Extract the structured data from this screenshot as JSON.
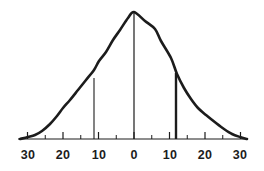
{
  "figure": {
    "kind": "bell-curve-figure",
    "background_color": "#ffffff",
    "ink_color": "#1c1c1c",
    "width": 264,
    "height": 171
  },
  "chart_data": {
    "type": "line",
    "title": "",
    "subtitle": "",
    "xlabel": "",
    "ylabel": "",
    "grid": false,
    "legend": false,
    "legend_position": "none",
    "axis": {
      "orientation": "horizontal",
      "baseline_y_px": 139,
      "x_start_px": 18,
      "x_end_px": 246,
      "center_px": 134,
      "px_per_unit": 3.55,
      "xlim": [
        -32,
        32
      ],
      "ylim": [
        0,
        1
      ],
      "tick_values": [
        -30,
        -25,
        -20,
        -15,
        -10,
        -5,
        0,
        5,
        10,
        15,
        20,
        25,
        30
      ],
      "major_tick_values": [
        -30,
        -20,
        -10,
        0,
        10,
        20,
        30
      ],
      "minor_tick_values": [
        -25,
        -15,
        -5,
        5,
        15,
        25
      ]
    },
    "tick_labels": [
      {
        "text": "30",
        "value": -30,
        "x_px": 28
      },
      {
        "text": "20",
        "value": -20,
        "x_px": 63
      },
      {
        "text": "10",
        "value": -10,
        "x_px": 99
      },
      {
        "text": "0",
        "value": 0,
        "x_px": 134
      },
      {
        "text": "10",
        "value": 10,
        "x_px": 170
      },
      {
        "text": "20",
        "value": 20,
        "x_px": 205
      },
      {
        "text": "30",
        "value": 30,
        "x_px": 240
      }
    ],
    "curve": {
      "name": "normal-distribution-curve",
      "stroke_color": "#1c1c1c",
      "stroke_width": 2.6,
      "peak": {
        "x": 0,
        "y": 1.0,
        "x_px": 134,
        "y_px": 12
      },
      "points": [
        {
          "x": -32,
          "y": 0.0,
          "x_px": 20,
          "y_px": 139
        },
        {
          "x": -30,
          "y": 0.01,
          "x_px": 28,
          "y_px": 137
        },
        {
          "x": -28,
          "y": 0.03,
          "x_px": 35,
          "y_px": 135
        },
        {
          "x": -26,
          "y": 0.07,
          "x_px": 42,
          "y_px": 131
        },
        {
          "x": -24,
          "y": 0.12,
          "x_px": 50,
          "y_px": 124
        },
        {
          "x": -22,
          "y": 0.19,
          "x_px": 57,
          "y_px": 116
        },
        {
          "x": -20,
          "y": 0.27,
          "x_px": 63,
          "y_px": 108
        },
        {
          "x": -18,
          "y": 0.35,
          "x_px": 70,
          "y_px": 100
        },
        {
          "x": -16,
          "y": 0.44,
          "x_px": 78,
          "y_px": 90
        },
        {
          "x": -14,
          "y": 0.53,
          "x_px": 86,
          "y_px": 80
        },
        {
          "x": -12,
          "y": 0.62,
          "x_px": 94,
          "y_px": 70
        },
        {
          "x": -10,
          "y": 0.71,
          "x_px": 99,
          "y_px": 61
        },
        {
          "x": -8,
          "y": 0.79,
          "x_px": 106,
          "y_px": 52
        },
        {
          "x": -6,
          "y": 0.87,
          "x_px": 113,
          "y_px": 40
        },
        {
          "x": -4,
          "y": 0.93,
          "x_px": 120,
          "y_px": 30
        },
        {
          "x": -2,
          "y": 0.98,
          "x_px": 128,
          "y_px": 18
        },
        {
          "x": 0,
          "y": 1.0,
          "x_px": 134,
          "y_px": 12
        },
        {
          "x": 3,
          "y": 0.95,
          "x_px": 145,
          "y_px": 21
        },
        {
          "x": 6,
          "y": 0.91,
          "x_px": 155,
          "y_px": 29
        },
        {
          "x": 8,
          "y": 0.82,
          "x_px": 161,
          "y_px": 41
        },
        {
          "x": 11,
          "y": 0.68,
          "x_px": 171,
          "y_px": 58
        },
        {
          "x": 13,
          "y": 0.57,
          "x_px": 177,
          "y_px": 74
        },
        {
          "x": 15,
          "y": 0.46,
          "x_px": 184,
          "y_px": 88
        },
        {
          "x": 17,
          "y": 0.36,
          "x_px": 191,
          "y_px": 99
        },
        {
          "x": 19,
          "y": 0.28,
          "x_px": 198,
          "y_px": 108
        },
        {
          "x": 21,
          "y": 0.21,
          "x_px": 206,
          "y_px": 115
        },
        {
          "x": 24,
          "y": 0.13,
          "x_px": 216,
          "y_px": 123
        },
        {
          "x": 26,
          "y": 0.08,
          "x_px": 224,
          "y_px": 129
        },
        {
          "x": 28,
          "y": 0.04,
          "x_px": 232,
          "y_px": 134
        },
        {
          "x": 30,
          "y": 0.01,
          "x_px": 240,
          "y_px": 137
        },
        {
          "x": 32,
          "y": 0.0,
          "x_px": 247,
          "y_px": 139
        }
      ]
    },
    "vertical_lines": [
      {
        "name": "left-reference-line",
        "x": -12,
        "x_px": 94,
        "top_y_px": 78,
        "bottom_y_px": 139,
        "stroke_width": 1.1,
        "stroke_color": "#1c1c1c"
      },
      {
        "name": "center-line",
        "x": 0,
        "x_px": 134,
        "top_y_px": 13,
        "bottom_y_px": 139,
        "stroke_width": 1.2,
        "stroke_color": "#1c1c1c"
      },
      {
        "name": "right-reference-line",
        "x": 13,
        "x_px": 176,
        "top_y_px": 73,
        "bottom_y_px": 139,
        "stroke_width": 2.4,
        "stroke_color": "#1c1c1c"
      }
    ]
  }
}
